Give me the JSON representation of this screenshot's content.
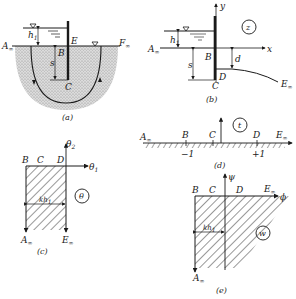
{
  "figure": {
    "panels": [
      {
        "id": "a",
        "caption": "(a)",
        "labels": {
          "A": "A",
          "A_sub": "∞",
          "F": "F",
          "F_sub": "∞",
          "E": "E",
          "B": "B",
          "C": "C",
          "h": "h",
          "h_sub": "1",
          "s": "s"
        }
      },
      {
        "id": "b",
        "caption": "(b)",
        "plane": "z",
        "labels": {
          "y": "y",
          "x": "x",
          "A": "A",
          "A_sub": "∞",
          "B": "B",
          "C": "C",
          "D": "D",
          "E": "E",
          "E_sub": "∞",
          "h": "h",
          "h_sub": "1",
          "s": "s",
          "d": "d"
        }
      },
      {
        "id": "c",
        "caption": "(c)",
        "plane": "θ",
        "labels": {
          "theta2": "θ",
          "theta2_sub": "2",
          "theta1": "θ",
          "theta1_sub": "1",
          "B": "B",
          "C": "C",
          "D": "D",
          "A": "A",
          "A_sub": "∞",
          "E": "E",
          "E_sub": "∞",
          "width": "kh",
          "width_sub": "1"
        }
      },
      {
        "id": "d",
        "caption": "(d)",
        "plane": "t",
        "labels": {
          "A": "A",
          "A_sub": "∞",
          "B": "B",
          "C": "C",
          "D": "D",
          "E": "E",
          "E_sub": "∞",
          "minus1": "−1",
          "plus1": "+1"
        }
      },
      {
        "id": "e",
        "caption": "(e)",
        "plane": "w",
        "labels": {
          "psi": "ψ",
          "phi": "ϕ",
          "B": "B",
          "C": "C",
          "D": "D",
          "E": "E",
          "E_sub": "∞",
          "A": "A",
          "A_sub": "∞",
          "width": "kh",
          "width_sub": "1"
        }
      }
    ],
    "colors": {
      "ink": "#1a1a1a",
      "soil": "#c9c9c9",
      "background": "#ffffff"
    }
  }
}
